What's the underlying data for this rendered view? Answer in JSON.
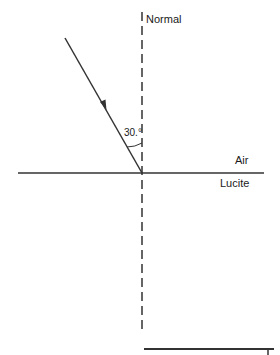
{
  "diagram": {
    "title": "",
    "labels": {
      "normal": "Normal",
      "angle": "30.°",
      "upper_medium": "Air",
      "lower_medium": "Lucite"
    },
    "incident_angle_deg": 30,
    "colors": {
      "line": "#333333",
      "text": "#1a1a1a",
      "background": "#ffffff"
    },
    "elements": [
      {
        "type": "normal-line",
        "style": "dashed",
        "orientation": "vertical"
      },
      {
        "type": "boundary-line",
        "style": "solid",
        "orientation": "horizontal"
      },
      {
        "type": "incident-ray",
        "style": "solid",
        "arrow": "toward-boundary"
      },
      {
        "type": "angle-arc",
        "between": [
          "incident-ray",
          "normal-line"
        ]
      },
      {
        "type": "answer-line",
        "style": "solid",
        "orientation": "horizontal"
      }
    ]
  }
}
